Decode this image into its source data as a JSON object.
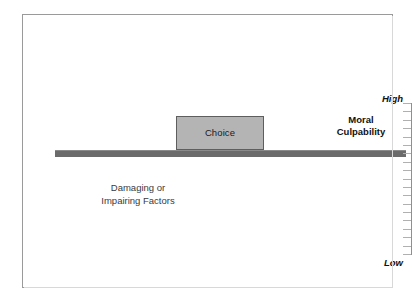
{
  "diagram": {
    "frame": {
      "border_color": "#9a9a9a",
      "background_color": "#ffffff"
    },
    "beam": {
      "name": "horizontal-beam",
      "color": "#6b6b6b"
    },
    "choice_block": {
      "label": "Choice",
      "fill_color": "#b4b4b4",
      "border_color": "#5e5e5e"
    },
    "right_label": {
      "line1": "Moral",
      "line2": "Culpability"
    },
    "left_label": {
      "line1": "Damaging or",
      "line2": "Impairing Factors"
    },
    "scale": {
      "high_label": "High",
      "low_label": "Low",
      "tick_count": 19,
      "axis_color": "#8f8f8f",
      "tick_color": "#b0b0b0"
    }
  }
}
